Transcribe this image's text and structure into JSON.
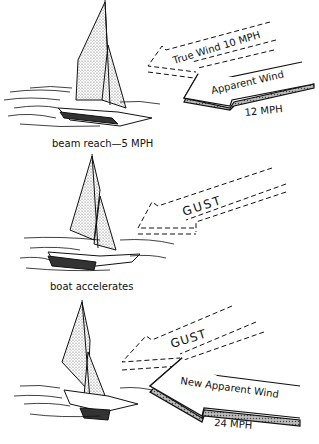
{
  "panels": [
    {
      "caption": "beam reach—5 MPH",
      "wind_arrow_1": "True Wind 10 MPH",
      "wind_arrow_2": "Apparent Wind",
      "wind_speed_2": "12 MPH"
    },
    {
      "caption": "boat accelerates",
      "wind_arrow_1": "GUST"
    },
    {
      "wind_arrow_1": "GUST",
      "wind_arrow_2": "New Apparent Wind",
      "wind_speed_2": "24 MPH"
    }
  ],
  "colors": {
    "ink": "#111111",
    "paper": "#ffffff",
    "stipple": "#9a9a9a"
  }
}
